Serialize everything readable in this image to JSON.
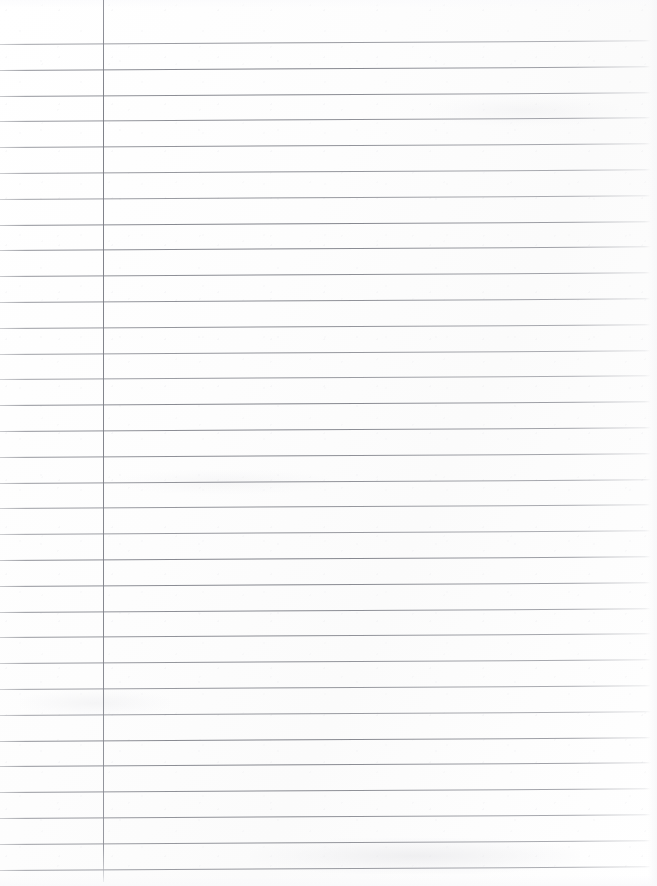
{
  "document": {
    "kind": "scanned-ruled-paper",
    "title": "Blank ruled notebook page",
    "visible_text": "",
    "handwriting": "none",
    "page_width": 657,
    "page_height": 886,
    "background_color": "#fefefe"
  },
  "paper": {
    "surface_color": "#fdfdfd",
    "texture_note": "faint scanner noise and light gray smudge bands"
  },
  "ruling": {
    "line_color": "#7c7e86",
    "line_thickness": 1,
    "line_spacing": 25.8,
    "first_line_y": 44,
    "line_count": 33,
    "line_start_x": 0,
    "line_end_x": 651,
    "skew_degrees": -0.32,
    "line_y_positions": [
      44,
      69.8,
      95.6,
      121.4,
      147.2,
      173,
      198.8,
      224.6,
      250.4,
      276.2,
      302,
      327.8,
      353.6,
      379.4,
      405.2,
      431,
      456.8,
      482.6,
      508.4,
      534.2,
      560,
      585.8,
      611.6,
      637.4,
      663.2,
      689,
      714.8,
      740.6,
      766.4,
      792.2,
      818,
      843.8,
      869.6
    ]
  },
  "margin_rule": {
    "orientation": "vertical",
    "color": "#7a7c84",
    "x": 103,
    "top_y": 0,
    "bottom_y": 882,
    "thickness": 1.4
  },
  "smudges": [
    {
      "name": "smudge-bottom-center",
      "x": 250,
      "y": 838,
      "width": 330,
      "height": 36
    },
    {
      "name": "smudge-left-mid",
      "x": 20,
      "y": 690,
      "width": 150,
      "height": 26
    },
    {
      "name": "smudge-top-right",
      "x": 430,
      "y": 96,
      "width": 190,
      "height": 30
    },
    {
      "name": "smudge-center-left",
      "x": 120,
      "y": 470,
      "width": 210,
      "height": 24
    }
  ]
}
